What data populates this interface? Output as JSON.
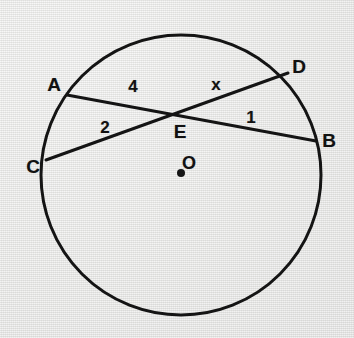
{
  "figure": {
    "kind": "circle-geometry-diagram",
    "background_color": "#e9e9e8",
    "stroke_color": "#141414",
    "text_color": "#111111",
    "circle": {
      "center_x": 181,
      "center_y": 175,
      "radius": 140,
      "stroke_width": 3
    },
    "center_dot": {
      "x": 181,
      "y": 173,
      "radius": 4
    },
    "chords": [
      {
        "name": "chord-AB",
        "from": "A",
        "to": "B",
        "x1": 67,
        "y1": 95,
        "x2": 316,
        "y2": 141,
        "stroke_width": 3
      },
      {
        "name": "chord-CD",
        "from": "C",
        "to": "D",
        "x1": 46,
        "y1": 160,
        "x2": 288,
        "y2": 73,
        "stroke_width": 3
      }
    ],
    "points": [
      {
        "id": "A",
        "label": "A",
        "label_x": 54,
        "label_y": 84,
        "class": "point-label"
      },
      {
        "id": "D",
        "label": "D",
        "label_x": 299,
        "label_y": 66,
        "class": "point-label"
      },
      {
        "id": "C",
        "label": "C",
        "label_x": 33,
        "label_y": 166,
        "class": "point-label"
      },
      {
        "id": "B",
        "label": "B",
        "label_x": 329,
        "label_y": 140,
        "class": "point-label"
      },
      {
        "id": "E",
        "label": "E",
        "label_x": 180,
        "label_y": 131,
        "class": "point-label"
      },
      {
        "id": "O",
        "label": "O",
        "label_x": 189,
        "label_y": 163,
        "class": "center-label"
      }
    ],
    "measures": [
      {
        "id": "AE",
        "label": "4",
        "label_x": 133,
        "label_y": 86,
        "segment": "A to E"
      },
      {
        "id": "ED",
        "label": "x",
        "label_x": 216,
        "label_y": 84,
        "segment": "E to D"
      },
      {
        "id": "CE",
        "label": "2",
        "label_x": 105,
        "label_y": 127,
        "segment": "C to E"
      },
      {
        "id": "EB",
        "label": "1",
        "label_x": 251,
        "label_y": 117,
        "segment": "E to B"
      }
    ]
  }
}
